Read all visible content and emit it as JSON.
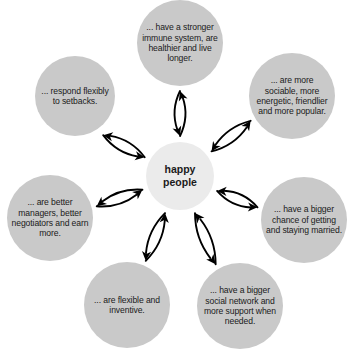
{
  "diagram": {
    "center": {
      "label": "happy\npeople",
      "label_line1": "happy",
      "label_line2": "people",
      "color": "#ebebeb"
    },
    "node_color": "#c9c9c9",
    "arrow_color": "#000000",
    "background": "#ffffff",
    "nodes": [
      {
        "id": "immune",
        "label": "... have a stronger immune system, are healthier and live longer.",
        "angle_deg": 270,
        "cx": 180,
        "cy": 43,
        "r": 43,
        "font_size": 8.6
      },
      {
        "id": "sociable",
        "label": "... are more sociable, more energetic, friendlier and more popular.",
        "angle_deg": 322,
        "cx": 292,
        "cy": 96,
        "r": 43,
        "font_size": 8.6
      },
      {
        "id": "married",
        "label": "... have a bigger chance of getting and staying married.",
        "angle_deg": 22,
        "cx": 304,
        "cy": 220,
        "r": 43,
        "font_size": 8.6
      },
      {
        "id": "network",
        "label": "... have a bigger social network and more support when needed.",
        "angle_deg": 68,
        "cx": 240,
        "cy": 306,
        "r": 43,
        "font_size": 8.6
      },
      {
        "id": "flexible",
        "label": "... are flexible and inventive.",
        "angle_deg": 112,
        "cx": 127,
        "cy": 305,
        "r": 43,
        "font_size": 8.6
      },
      {
        "id": "managers",
        "label": "... are better managers, better negotiators and earn more.",
        "angle_deg": 160,
        "cx": 50,
        "cy": 218,
        "r": 43,
        "font_size": 8.6
      },
      {
        "id": "setbacks",
        "label": "... respond flexibly to setbacks.",
        "angle_deg": 208,
        "cx": 75,
        "cy": 96,
        "r": 40,
        "font_size": 8.6
      }
    ],
    "connectors": [
      {
        "id": "connector-immune",
        "from": "center",
        "to": "immune",
        "bidirectional": true
      },
      {
        "id": "connector-sociable",
        "from": "center",
        "to": "sociable",
        "bidirectional": true
      },
      {
        "id": "connector-married",
        "from": "center",
        "to": "married",
        "bidirectional": true
      },
      {
        "id": "connector-network",
        "from": "center",
        "to": "network",
        "bidirectional": true
      },
      {
        "id": "connector-flexible",
        "from": "center",
        "to": "flexible",
        "bidirectional": true
      },
      {
        "id": "connector-managers",
        "from": "center",
        "to": "managers",
        "bidirectional": true
      },
      {
        "id": "connector-setbacks",
        "from": "center",
        "to": "setbacks",
        "bidirectional": true
      }
    ]
  }
}
